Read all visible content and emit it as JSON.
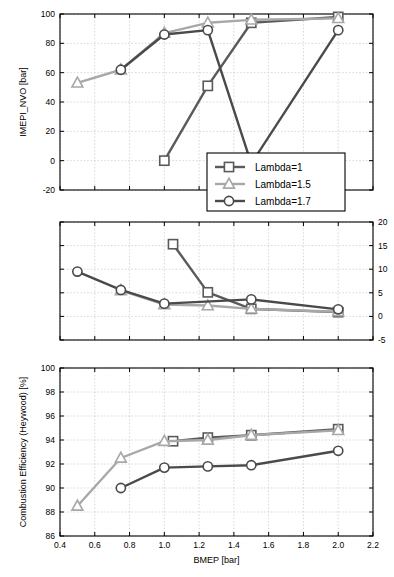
{
  "chart_data": [
    {
      "type": "line",
      "panel": "top",
      "title": "",
      "xlabel": "",
      "ylabel": "IMEPI_NVO [bar]",
      "xlim": [
        0.4,
        2.2
      ],
      "ylim": [
        -20,
        100
      ],
      "xticks": [
        0.4,
        0.6,
        0.8,
        1.0,
        1.2,
        1.4,
        1.6,
        1.8,
        2.0,
        2.2
      ],
      "yticks": [
        -20,
        0,
        20,
        40,
        60,
        80,
        100
      ],
      "grid": true,
      "series": [
        {
          "name": "Lambda=1",
          "marker": "square",
          "x": [
            1.0,
            1.25,
            1.5,
            2.0
          ],
          "values": [
            0,
            51,
            94,
            98
          ]
        },
        {
          "name": "Lambda=1.5",
          "marker": "triangle",
          "x": [
            0.5,
            0.75,
            1.0,
            1.25,
            1.5,
            2.0
          ],
          "values": [
            53,
            62,
            87,
            94,
            96,
            97
          ]
        },
        {
          "name": "Lambda=1.7",
          "marker": "circle",
          "x": [
            0.75,
            1.0,
            1.25,
            1.5,
            2.0
          ],
          "values": [
            62,
            86,
            89,
            -2,
            89
          ]
        }
      ]
    },
    {
      "type": "line",
      "panel": "middle",
      "title": "",
      "xlabel": "",
      "ylabel": "IMEPcov0 [%]",
      "xlim": [
        0.4,
        2.2
      ],
      "ylim": [
        -5,
        20
      ],
      "xticks": [
        0.4,
        0.6,
        0.8,
        1.0,
        1.2,
        1.4,
        1.6,
        1.8,
        2.0,
        2.2
      ],
      "yticks": [
        -5,
        0,
        5,
        10,
        15,
        20
      ],
      "grid": true,
      "series": [
        {
          "name": "Lambda=1",
          "marker": "square",
          "x": [
            1.05,
            1.25,
            1.5,
            2.0
          ],
          "values": [
            15.3,
            5.1,
            1.6,
            0.9
          ]
        },
        {
          "name": "Lambda=1.5",
          "marker": "triangle",
          "x": [
            0.75,
            1.0,
            1.25,
            1.5,
            2.0
          ],
          "values": [
            5.5,
            2.5,
            2.3,
            1.6,
            1.0
          ]
        },
        {
          "name": "Lambda=1.7",
          "marker": "circle",
          "x": [
            0.5,
            0.75,
            1.0,
            1.5,
            2.0
          ],
          "values": [
            9.5,
            5.6,
            2.7,
            3.6,
            1.5
          ]
        }
      ]
    },
    {
      "type": "line",
      "panel": "bottom",
      "title": "",
      "xlabel": "BMEP [bar]",
      "ylabel": "Combustion Efficiency (Heywood) [%]",
      "xlim": [
        0.4,
        2.2
      ],
      "ylim": [
        86,
        100
      ],
      "xticks": [
        0.4,
        0.6,
        0.8,
        1.0,
        1.2,
        1.4,
        1.6,
        1.8,
        2.0,
        2.2
      ],
      "yticks": [
        86,
        88,
        90,
        92,
        94,
        96,
        98,
        100
      ],
      "grid": true,
      "series": [
        {
          "name": "Lambda=1",
          "marker": "square",
          "x": [
            1.05,
            1.25,
            1.5,
            2.0
          ],
          "values": [
            93.9,
            94.2,
            94.4,
            94.9
          ]
        },
        {
          "name": "Lambda=1.5",
          "marker": "triangle",
          "x": [
            0.5,
            0.75,
            1.0,
            1.25,
            1.5,
            2.0
          ],
          "values": [
            88.5,
            92.5,
            93.9,
            94.0,
            94.4,
            94.8
          ]
        },
        {
          "name": "Lambda=1.7",
          "marker": "circle",
          "x": [
            0.75,
            1.0,
            1.25,
            1.5,
            2.0
          ],
          "values": [
            90.0,
            91.7,
            91.8,
            91.9,
            93.1
          ]
        }
      ]
    }
  ],
  "legend": {
    "position": "middle-right-of-top-panel",
    "entries": [
      {
        "label": "Lambda=1",
        "marker": "square",
        "color": "#5a5a5a"
      },
      {
        "label": "Lambda=1.5",
        "marker": "triangle",
        "color": "#a8a8a8"
      },
      {
        "label": "Lambda=1.7",
        "marker": "circle",
        "color": "#4a4a4a"
      }
    ]
  },
  "axes": {
    "top": {
      "ylabel": "IMEPI_NVO [bar]",
      "yticks": [
        "-20",
        "0",
        "20",
        "40",
        "60",
        "80",
        "100"
      ]
    },
    "middle": {
      "ylabel": "IMEPcov0 [%]",
      "yticks": [
        "-5",
        "0",
        "5",
        "10",
        "15",
        "20"
      ]
    },
    "bottom": {
      "ylabel": "Combustion Efficiency (Heywood) [%]",
      "yticks": [
        "86",
        "88",
        "90",
        "92",
        "94",
        "96",
        "98",
        "100"
      ],
      "xlabel": "BMEP [bar]",
      "xticks": [
        "0.4",
        "0.6",
        "0.8",
        "1.0",
        "1.2",
        "1.4",
        "1.6",
        "1.8",
        "2.0",
        "2.2"
      ]
    }
  },
  "colors": {
    "lambda1": "#5a5a5a",
    "lambda15": "#a8a8a8",
    "lambda17": "#4a4a4a",
    "grid": "#c8c8c8",
    "axis": "#000000",
    "background": "#ffffff"
  }
}
